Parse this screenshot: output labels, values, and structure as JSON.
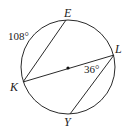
{
  "diagram": {
    "type": "circle-geometry",
    "circle": {
      "cx": 68,
      "cy": 67,
      "r": 47,
      "center_dot": true
    },
    "points": [
      {
        "name": "E",
        "x": 66,
        "y": 20
      },
      {
        "name": "L",
        "x": 114,
        "y": 55
      },
      {
        "name": "K",
        "x": 23,
        "y": 82
      },
      {
        "name": "Y",
        "x": 70,
        "y": 114
      }
    ],
    "segments": [
      {
        "from": "K",
        "to": "E"
      },
      {
        "from": "K",
        "to": "L",
        "note": "diameter through center"
      },
      {
        "from": "L",
        "to": "Y"
      }
    ],
    "labels": {
      "E": "E",
      "L": "L",
      "K": "K",
      "Y": "Y",
      "arc_KE": "108°",
      "angle_KLY": "36°"
    },
    "colors": {
      "stroke": "#2a2a2a",
      "text": "#222222"
    }
  }
}
